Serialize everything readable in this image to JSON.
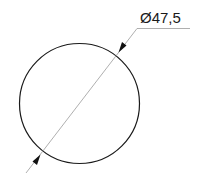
{
  "drawing": {
    "dimension": {
      "type": "diameter",
      "label": "Ø47,5",
      "value": 47.5
    },
    "colors": {
      "circle": "#1a1a1a",
      "leader": "#9a9a9a",
      "arrow": "#111111",
      "text": "#1a1a1a",
      "background": "#ffffff"
    }
  }
}
